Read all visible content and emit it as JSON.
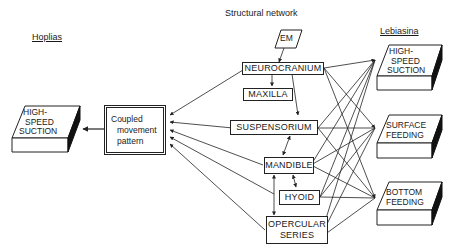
{
  "diagram": {
    "headers": {
      "left_species": "Hoplias",
      "center_title": "Structural network",
      "right_species": "Lebiasina"
    },
    "hoplias_output": {
      "lines": [
        "HIGH-",
        "SPEED",
        "SUCTION"
      ]
    },
    "coupled_box": {
      "lines": [
        "Coupled",
        "movement",
        "pattern"
      ]
    },
    "network_nodes": {
      "em": "EM",
      "neurocranium": "NEUROCRANIUM",
      "maxilla": "MAXILLA",
      "suspensorium": "SUSPENSORIUM",
      "mandible": "MANDIBLE",
      "hyoid": "HYOID",
      "opercular": [
        "OPERCULAR",
        "SERIES"
      ]
    },
    "lebiasina_outputs": [
      {
        "lines": [
          "HIGH-",
          "SPEED",
          "SUCTION"
        ]
      },
      {
        "lines": [
          "SURFACE",
          "FEEDING"
        ]
      },
      {
        "lines": [
          "BOTTOM",
          "FEEDING"
        ]
      }
    ],
    "colors": {
      "ink": "#222222",
      "shadow": "#111111",
      "background": "#ffffff"
    }
  }
}
